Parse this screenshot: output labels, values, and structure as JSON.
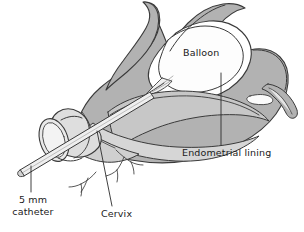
{
  "figure": {
    "type": "medical-illustration",
    "background_color": "#ffffff",
    "line_color": "#3a3a3a",
    "fill_myometrium": "#b2b2b2",
    "fill_endometrium": "#c7c7c7",
    "fill_cavity": "#ffffff",
    "fill_catheter": "#dedede"
  },
  "labels": {
    "balloon": "Balloon",
    "endometrial_lining": "Endometrial lining",
    "cervix": "Cervix",
    "catheter_line1": "5 mm",
    "catheter_line2": "catheter"
  },
  "leader_lines": [
    {
      "name": "endometrial-leader",
      "x1": 221,
      "y1": 73,
      "x2": 221,
      "y2": 145
    },
    {
      "name": "cervix-leader",
      "x1": 97,
      "y1": 131,
      "x2": 112,
      "y2": 206
    },
    {
      "name": "catheter-leader",
      "x1": 31,
      "y1": 166,
      "x2": 31,
      "y2": 192
    }
  ],
  "anatomy_parts": [
    "uterine-fundus",
    "myometrium-wall",
    "endometrial-lining",
    "uterine-cavity",
    "fallopian-tube",
    "cervix",
    "cervical-vessels",
    "balloon",
    "catheter-shaft",
    "catheter-barrel"
  ]
}
